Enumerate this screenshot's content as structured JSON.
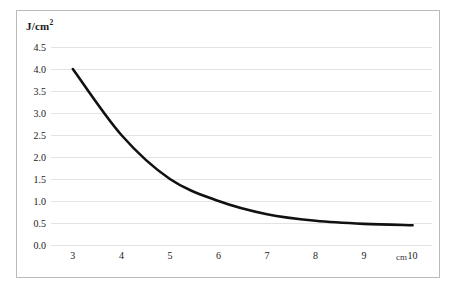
{
  "figure": {
    "background_color": "#ffffff",
    "frame_color": "#b9b9b9",
    "grid_color": "#e3e3e3",
    "curve_color": "#111111",
    "y_axis_caption": "J/cm",
    "y_axis_caption_superscript": "2",
    "x_axis_unit": "cm"
  },
  "chart_data": {
    "type": "line",
    "title": "",
    "subtitle": "",
    "xlabel": "cm",
    "ylabel": "J/cm2",
    "x": [
      3,
      4,
      5,
      6,
      7,
      8,
      9,
      10
    ],
    "values": [
      4.0,
      2.5,
      1.5,
      1.0,
      0.7,
      0.55,
      0.48,
      0.45
    ],
    "series": [
      {
        "name": "dose",
        "values": [
          4.0,
          2.5,
          1.5,
          1.0,
          0.7,
          0.55,
          0.48,
          0.45
        ]
      }
    ],
    "xtick_labels": [
      "3",
      "4",
      "5",
      "6",
      "7",
      "8",
      "9",
      "10"
    ],
    "ytick_labels": [
      "0.0",
      "0.5",
      "1.0",
      "1.5",
      "2.0",
      "2.5",
      "3.0",
      "3.5",
      "4.0",
      "4.5"
    ],
    "ytick_values": [
      0.0,
      0.5,
      1.0,
      1.5,
      2.0,
      2.5,
      3.0,
      3.5,
      4.0,
      4.5
    ],
    "xlim": [
      2.55,
      10.4
    ],
    "ylim": [
      0.0,
      4.5
    ],
    "grid": "horizontal",
    "legend": "none",
    "annotations": []
  }
}
